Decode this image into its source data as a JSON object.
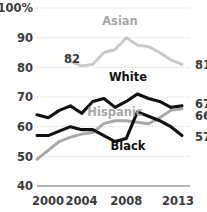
{
  "chart_data": {
    "type": "line",
    "title": "",
    "subtitle": "",
    "xlabel": "",
    "ylabel": "",
    "x": [
      2000,
      2001,
      2002,
      2003,
      2004,
      2005,
      2006,
      2007,
      2008,
      2009,
      2010,
      2011,
      2012,
      2013
    ],
    "xlim": [
      2000,
      2013
    ],
    "ylim": [
      40,
      100
    ],
    "yticks": [
      40,
      50,
      60,
      70,
      80,
      90,
      100
    ],
    "ytick_labels": [
      "40",
      "50",
      "60",
      "70",
      "80",
      "90",
      "100%"
    ],
    "xticks": [
      2000,
      2004,
      2008,
      2013
    ],
    "xtick_labels": [
      "2000",
      "2004",
      "2008",
      "2013"
    ],
    "grid": true,
    "grid_style": "dotted-horizontal",
    "legend_position": "inline-labels",
    "series": [
      {
        "name": "Asian",
        "color": "#c9c9c9",
        "label_color": "#b5b5b5",
        "x": [
          2003,
          2004,
          2005,
          2006,
          2007,
          2008,
          2009,
          2010,
          2011,
          2012,
          2013
        ],
        "values": [
          82,
          80.5,
          81,
          85,
          86,
          90,
          87.5,
          87,
          85,
          82.5,
          81
        ],
        "start_label": "82",
        "end_label": "81"
      },
      {
        "name": "White",
        "color": "#111111",
        "label_color": "#111111",
        "x": [
          2000,
          2001,
          2002,
          2003,
          2004,
          2005,
          2006,
          2007,
          2008,
          2009,
          2010,
          2011,
          2012,
          2013
        ],
        "values": [
          64,
          63,
          65.5,
          67,
          64.5,
          68.5,
          69.5,
          66.5,
          68.5,
          71,
          69.5,
          68.5,
          66.5,
          67
        ],
        "end_label": "67"
      },
      {
        "name": "Hispanic",
        "color": "#a8a8a8",
        "label_color": "#b0b0b0",
        "x": [
          2000,
          2001,
          2002,
          2003,
          2004,
          2005,
          2006,
          2007,
          2008,
          2009,
          2010,
          2011,
          2012,
          2013
        ],
        "values": [
          49,
          52,
          55,
          56.5,
          57.5,
          58,
          61,
          62,
          62,
          61.5,
          61,
          63,
          65.5,
          66
        ],
        "end_label": "66"
      },
      {
        "name": "Black",
        "color": "#111111",
        "label_color": "#111111",
        "x": [
          2000,
          2001,
          2002,
          2003,
          2004,
          2005,
          2006,
          2007,
          2008,
          2009,
          2010,
          2011,
          2012,
          2013
        ],
        "values": [
          57,
          57,
          58.5,
          60,
          59,
          59,
          57,
          55,
          56,
          65,
          63.5,
          62,
          60,
          57
        ],
        "end_label": "57"
      }
    ],
    "series_labels": [
      {
        "text": "Asian",
        "x": 120,
        "y": 25,
        "tone": "gray"
      },
      {
        "text": "White",
        "x": 128,
        "y": 81,
        "tone": "dark"
      },
      {
        "text": "Hispanic",
        "x": 115,
        "y": 116,
        "tone": "gray"
      },
      {
        "text": "Black",
        "x": 128,
        "y": 150,
        "tone": "dark"
      }
    ],
    "annotations": [
      {
        "text": "82",
        "x": 72,
        "y": 63
      },
      {
        "text": "81",
        "x": 195,
        "y": 69
      },
      {
        "text": "67",
        "x": 195,
        "y": 108
      },
      {
        "text": "66",
        "x": 195,
        "y": 120
      },
      {
        "text": "57",
        "x": 195,
        "y": 141
      }
    ],
    "colors": {
      "axis_text": "#3a3a3a",
      "grid": "#cfcfcf",
      "baseline": "#9a9a9a",
      "background": "#ffffff",
      "dark_series": "#111111",
      "light_series": "#c9c9c9",
      "mid_series": "#a8a8a8"
    }
  }
}
